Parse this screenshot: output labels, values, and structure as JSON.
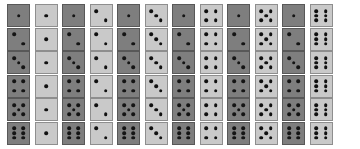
{
  "canvas": {
    "width": 360,
    "height": 149,
    "background": "#ffffff"
  },
  "styles": {
    "dark_face_color": "#7e7e7e",
    "dark_border_color": "#585858",
    "light_face_color": "#c9c9c9",
    "light_border_color": "#8e8e8e",
    "pip_color": "#141414",
    "die_size": 23,
    "row_pitch": 23.5,
    "col_pitch": 27.5,
    "pair_pitch": 55,
    "origin_x": 7,
    "origin_y": 4
  },
  "grid": {
    "rows": 6,
    "pair_columns": 6,
    "total_dice": 72,
    "row_faces": [
      1,
      2,
      3,
      4,
      5,
      6
    ],
    "pair_faces": [
      1,
      2,
      3,
      4,
      5,
      6
    ]
  },
  "pip_layouts": {
    "1": [
      "p-mc"
    ],
    "2": [
      "p-tl",
      "p-br"
    ],
    "3": [
      "p-tl",
      "p-mc",
      "p-br"
    ],
    "4": [
      "p-tl",
      "p-tr",
      "p-bl",
      "p-br"
    ],
    "5": [
      "p-tl",
      "p-tr",
      "p-mc",
      "p-bl",
      "p-br"
    ],
    "6": [
      "p-tl",
      "p-tr",
      "p-ml",
      "p-mr",
      "p-bl",
      "p-br"
    ]
  },
  "chart_data": {
    "type": "table",
    "xlabel": "Second die face (fixed per column pair)",
    "ylabel": "First die face (fixed per row)",
    "categories": [
      "1",
      "2",
      "3",
      "4",
      "5",
      "6"
    ],
    "rows": [
      "1",
      "2",
      "3",
      "4",
      "5",
      "6"
    ],
    "cells": [
      [
        [
          1,
          1
        ],
        [
          1,
          2
        ],
        [
          1,
          3
        ],
        [
          1,
          4
        ],
        [
          1,
          5
        ],
        [
          1,
          6
        ]
      ],
      [
        [
          2,
          1
        ],
        [
          2,
          2
        ],
        [
          2,
          3
        ],
        [
          2,
          4
        ],
        [
          2,
          5
        ],
        [
          2,
          6
        ]
      ],
      [
        [
          3,
          1
        ],
        [
          3,
          2
        ],
        [
          3,
          3
        ],
        [
          3,
          4
        ],
        [
          3,
          5
        ],
        [
          3,
          6
        ]
      ],
      [
        [
          4,
          1
        ],
        [
          4,
          2
        ],
        [
          4,
          3
        ],
        [
          4,
          4
        ],
        [
          4,
          5
        ],
        [
          4,
          6
        ]
      ],
      [
        [
          5,
          1
        ],
        [
          5,
          2
        ],
        [
          5,
          3
        ],
        [
          5,
          4
        ],
        [
          5,
          5
        ],
        [
          5,
          6
        ]
      ],
      [
        [
          6,
          1
        ],
        [
          6,
          2
        ],
        [
          6,
          3
        ],
        [
          6,
          4
        ],
        [
          6,
          5
        ],
        [
          6,
          6
        ]
      ]
    ],
    "legend": [
      {
        "name": "first-die-dark",
        "color": "#7e7e7e"
      },
      {
        "name": "second-die-light",
        "color": "#c9c9c9"
      }
    ],
    "grid": false
  }
}
